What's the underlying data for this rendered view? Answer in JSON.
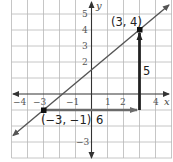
{
  "diagram": {
    "type": "coordinate-plane-slope",
    "axes": {
      "x_label": "x",
      "y_label": "y",
      "x_ticks": [
        {
          "value": -4,
          "label": "−4"
        },
        {
          "value": -3,
          "label": "−3"
        },
        {
          "value": -1,
          "label": "−1"
        },
        {
          "value": 1,
          "label": "1"
        },
        {
          "value": 2,
          "label": "2"
        },
        {
          "value": 4,
          "label": "4"
        }
      ],
      "y_ticks": [
        {
          "value": 5,
          "label": "5"
        },
        {
          "value": 4,
          "label": "4"
        },
        {
          "value": 3,
          "label": "3"
        },
        {
          "value": 2,
          "label": "2"
        },
        {
          "value": -3,
          "label": "−3"
        }
      ],
      "x_range": [
        -5,
        5
      ],
      "y_range": [
        -4,
        6
      ]
    },
    "line": {
      "through": [
        [
          -3,
          -1
        ],
        [
          3,
          4
        ]
      ],
      "color": "#555555"
    },
    "points": [
      {
        "x": 3,
        "y": 4,
        "label": "(3, 4)"
      },
      {
        "x": -3,
        "y": -1,
        "label": "(−3, −1)"
      }
    ],
    "run": {
      "from": [
        -3,
        -1
      ],
      "to": [
        3,
        -1
      ],
      "label": "6",
      "color": "#6b6b6b"
    },
    "rise": {
      "from": [
        3,
        -1
      ],
      "to": [
        3,
        4
      ],
      "label": "5",
      "color": "#222222"
    }
  },
  "colors": {
    "grid": "#b8b8b8",
    "axis": "#333333",
    "line": "#555555",
    "run_arrow": "#6b6b6b",
    "rise_arrow": "#222222",
    "point": "#111111"
  }
}
